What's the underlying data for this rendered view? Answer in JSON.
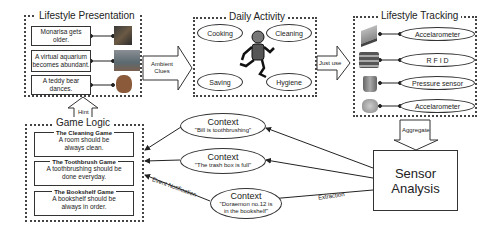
{
  "lifestyle_presentation": {
    "title": "Lifestyle Presentation",
    "items": [
      {
        "text": "Monarisa gets older.",
        "icon": "painting-icon"
      },
      {
        "text": "A virtual aquarium becomes abundant.",
        "icon": "aquarium-icon"
      },
      {
        "text": "A teddy bear dances.",
        "icon": "teddy-bear-icon"
      }
    ]
  },
  "daily_activity": {
    "title": "Daily Activity",
    "activities": [
      "Cooking",
      "Cleaning",
      "Saving",
      "Hygiene"
    ],
    "figure": "running-person-icon"
  },
  "lifestyle_tracking": {
    "title": "Lifestyle Tracking",
    "sensors": [
      {
        "label": "Accelarometer",
        "icon": "broom-icon"
      },
      {
        "label": "R F I D",
        "icon": "books-icon"
      },
      {
        "label": "Pressure sensor",
        "icon": "trash-box-icon"
      },
      {
        "label": "Accelarometer",
        "icon": "toothbrush-icon"
      }
    ]
  },
  "arrows": {
    "ambient_clues": "Ambient Clues",
    "just_use": "Just use",
    "hint": "Hint",
    "aggregate": "Aggregate",
    "event_notification": "Event Notification",
    "extraction": "Extraction"
  },
  "game_logic": {
    "title": "Game Logic",
    "games": [
      {
        "name": "The Cleaning Game",
        "rule": "A room should be always clean."
      },
      {
        "name": "The Toothbrush Game",
        "rule": "A toothbrushing should be done everyday."
      },
      {
        "name": "The Bookshelf Game",
        "rule": "A bookshelf should be always in order."
      }
    ]
  },
  "contexts": [
    {
      "title": "Context",
      "text": "\"Bill is toothbrushing\""
    },
    {
      "title": "Context",
      "text": "\"The trash box is full\""
    },
    {
      "title": "Context",
      "text": "\"Doraemon no.12 is in the bookshelf\""
    }
  ],
  "sensor_analysis": {
    "label": "Sensor Analysis"
  }
}
